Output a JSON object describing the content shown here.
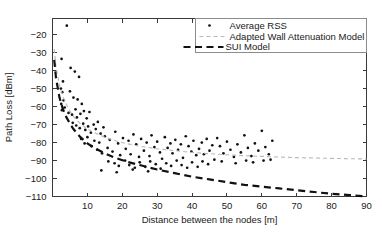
{
  "chart_data": {
    "type": "scatter",
    "title": "",
    "xlabel": "Distance between the nodes [m]",
    "ylabel": "Path Loss [dBm]",
    "xlim": [
      0,
      90
    ],
    "ylim": [
      -110,
      -11
    ],
    "xticks": [
      0,
      10,
      20,
      30,
      40,
      50,
      60,
      70,
      80,
      90
    ],
    "xticklabels": [
      "",
      "10",
      "20",
      "30",
      "40",
      "50",
      "60",
      "70",
      "80",
      "90"
    ],
    "yticks": [
      -20,
      -30,
      -40,
      -50,
      -60,
      -70,
      -80,
      -90,
      -100,
      -110
    ],
    "yticklabels": [
      "-20",
      "-30",
      "-40",
      "-50",
      "-60",
      "-70",
      "-80",
      "-90",
      "-100",
      "-110"
    ],
    "grid": false,
    "legend_position": "top-right",
    "colors": {
      "scatter": "#121212",
      "adapted_wall_model": "#b9b9b9",
      "sui_model": "#111111",
      "axis": "#3a3a3a",
      "legend_border": "#8c8c8c",
      "background": "#ffffff"
    },
    "series": [
      {
        "name": "Average RSS",
        "style": "points",
        "marker": "dot",
        "color": "#121212",
        "points": [
          [
            4.1,
            -15.0
          ],
          [
            2.6,
            -33.5
          ],
          [
            3.0,
            -46.0
          ],
          [
            2.4,
            -50.0
          ],
          [
            2.8,
            -52.0
          ],
          [
            3.2,
            -56.5
          ],
          [
            2.5,
            -58.5
          ],
          [
            3.5,
            -60.5
          ],
          [
            2.7,
            -62.0
          ],
          [
            5.2,
            -38.5
          ],
          [
            6.4,
            -40.5
          ],
          [
            7.6,
            -43.5
          ],
          [
            5.0,
            -51.5
          ],
          [
            6.0,
            -55.0
          ],
          [
            7.2,
            -56.0
          ],
          [
            8.4,
            -58.5
          ],
          [
            4.6,
            -63.5
          ],
          [
            5.6,
            -64.5
          ],
          [
            6.6,
            -61.5
          ],
          [
            7.0,
            -66.0
          ],
          [
            8.0,
            -64.0
          ],
          [
            9.0,
            -62.5
          ],
          [
            9.8,
            -66.5
          ],
          [
            10.6,
            -63.0
          ],
          [
            5.8,
            -69.0
          ],
          [
            6.8,
            -70.5
          ],
          [
            7.8,
            -72.0
          ],
          [
            8.8,
            -69.5
          ],
          [
            9.4,
            -73.0
          ],
          [
            10.2,
            -71.0
          ],
          [
            11.0,
            -74.5
          ],
          [
            11.8,
            -70.0
          ],
          [
            12.4,
            -72.5
          ],
          [
            13.0,
            -68.5
          ],
          [
            13.8,
            -75.0
          ],
          [
            14.6,
            -71.5
          ],
          [
            8.2,
            -78.0
          ],
          [
            9.2,
            -80.5
          ],
          [
            10.0,
            -77.0
          ],
          [
            11.2,
            -82.0
          ],
          [
            12.0,
            -79.0
          ],
          [
            12.8,
            -84.0
          ],
          [
            13.4,
            -80.0
          ],
          [
            14.2,
            -86.0
          ],
          [
            15.0,
            -76.5
          ],
          [
            15.8,
            -83.0
          ],
          [
            16.4,
            -78.5
          ],
          [
            17.2,
            -85.0
          ],
          [
            18.0,
            -74.0
          ],
          [
            18.8,
            -80.5
          ],
          [
            19.4,
            -87.0
          ],
          [
            20.2,
            -77.5
          ],
          [
            21.0,
            -83.5
          ],
          [
            21.8,
            -79.0
          ],
          [
            22.4,
            -86.5
          ],
          [
            23.2,
            -75.5
          ],
          [
            24.0,
            -81.0
          ],
          [
            24.8,
            -88.0
          ],
          [
            25.4,
            -78.0
          ],
          [
            26.2,
            -84.5
          ],
          [
            27.0,
            -80.0
          ],
          [
            27.8,
            -87.5
          ],
          [
            28.4,
            -76.0
          ],
          [
            29.2,
            -82.5
          ],
          [
            30.0,
            -79.5
          ],
          [
            30.8,
            -85.5
          ],
          [
            31.4,
            -89.0
          ],
          [
            32.2,
            -77.0
          ],
          [
            33.0,
            -83.0
          ],
          [
            33.8,
            -80.5
          ],
          [
            34.4,
            -86.0
          ],
          [
            35.2,
            -78.5
          ],
          [
            36.0,
            -84.0
          ],
          [
            36.8,
            -81.0
          ],
          [
            37.4,
            -88.5
          ],
          [
            38.2,
            -76.5
          ],
          [
            39.0,
            -82.0
          ],
          [
            39.8,
            -85.0
          ],
          [
            40.4,
            -79.0
          ],
          [
            41.2,
            -87.0
          ],
          [
            42.0,
            -83.5
          ],
          [
            42.8,
            -80.0
          ],
          [
            43.4,
            -86.5
          ],
          [
            44.2,
            -78.0
          ],
          [
            45.0,
            -84.5
          ],
          [
            45.8,
            -81.5
          ],
          [
            46.4,
            -89.5
          ],
          [
            47.2,
            -77.5
          ],
          [
            16.0,
            -90.5
          ],
          [
            17.8,
            -91.5
          ],
          [
            19.0,
            -93.0
          ],
          [
            20.8,
            -90.0
          ],
          [
            22.0,
            -92.5
          ],
          [
            23.6,
            -94.0
          ],
          [
            25.0,
            -91.0
          ],
          [
            26.6,
            -93.5
          ],
          [
            28.0,
            -90.5
          ],
          [
            29.6,
            -92.0
          ],
          [
            31.0,
            -94.5
          ],
          [
            32.6,
            -91.5
          ],
          [
            34.0,
            -93.0
          ],
          [
            35.6,
            -90.0
          ],
          [
            37.0,
            -92.5
          ],
          [
            38.6,
            -94.0
          ],
          [
            40.0,
            -91.0
          ],
          [
            41.6,
            -93.5
          ],
          [
            43.0,
            -90.5
          ],
          [
            44.6,
            -92.0
          ],
          [
            14.0,
            -95.5
          ],
          [
            18.4,
            -96.5
          ],
          [
            23.0,
            -95.0
          ],
          [
            27.4,
            -96.0
          ],
          [
            48.0,
            -82.0
          ],
          [
            49.0,
            -86.0
          ],
          [
            50.0,
            -79.5
          ],
          [
            51.0,
            -84.0
          ],
          [
            52.0,
            -88.0
          ],
          [
            53.0,
            -81.0
          ],
          [
            54.0,
            -85.5
          ],
          [
            55.0,
            -76.0
          ],
          [
            56.0,
            -83.0
          ],
          [
            57.0,
            -87.5
          ],
          [
            58.0,
            -80.5
          ],
          [
            59.0,
            -84.5
          ],
          [
            60.0,
            -73.5
          ],
          [
            61.0,
            -82.5
          ],
          [
            62.0,
            -86.5
          ],
          [
            63.0,
            -79.0
          ],
          [
            57.5,
            -91.0
          ],
          [
            60.5,
            -90.0
          ],
          [
            62.5,
            -89.5
          ],
          [
            48.5,
            -90.5
          ],
          [
            52.5,
            -91.5
          ],
          [
            55.5,
            -90.0
          ]
        ]
      },
      {
        "name": "Adapted Wall Attenuation Model",
        "style": "dashed-line",
        "color": "#b9b9b9",
        "x": [
          0.5,
          1,
          2,
          3,
          4,
          5,
          6,
          8,
          10,
          12,
          15,
          18,
          21,
          25,
          30,
          35,
          40,
          45,
          50,
          55,
          60,
          65,
          70,
          75,
          80,
          85,
          90
        ],
        "y": [
          -28.0,
          -38.0,
          -48.0,
          -54.5,
          -59.0,
          -62.5,
          -65.5,
          -69.5,
          -72.5,
          -74.5,
          -77.0,
          -79.0,
          -80.5,
          -82.0,
          -83.5,
          -84.5,
          -85.5,
          -86.2,
          -86.8,
          -87.3,
          -87.7,
          -88.1,
          -88.4,
          -88.6,
          -88.8,
          -89.0,
          -89.1
        ]
      },
      {
        "name": "SUI Model",
        "style": "dashed-line-bold",
        "color": "#111111",
        "x": [
          0.5,
          1,
          2,
          3,
          4,
          5,
          6,
          8,
          10,
          12,
          15,
          18,
          21,
          25,
          30,
          35,
          40,
          45,
          50,
          55,
          60,
          65,
          70,
          75,
          80,
          85,
          90
        ],
        "y": [
          -34.0,
          -44.0,
          -55.0,
          -61.5,
          -66.0,
          -69.5,
          -72.5,
          -77.0,
          -80.5,
          -83.0,
          -86.0,
          -88.5,
          -90.5,
          -92.5,
          -95.0,
          -97.0,
          -99.0,
          -100.5,
          -102.0,
          -103.5,
          -104.5,
          -105.5,
          -106.5,
          -107.5,
          -108.5,
          -109.2,
          -110.0
        ]
      }
    ]
  },
  "legend": {
    "entries": [
      {
        "label": "Average RSS",
        "marker": "dot"
      },
      {
        "label": "Adapted Wall Attenuation Model",
        "marker": "dash-gray"
      },
      {
        "label": "SUI Model",
        "marker": "dash-black"
      }
    ]
  }
}
